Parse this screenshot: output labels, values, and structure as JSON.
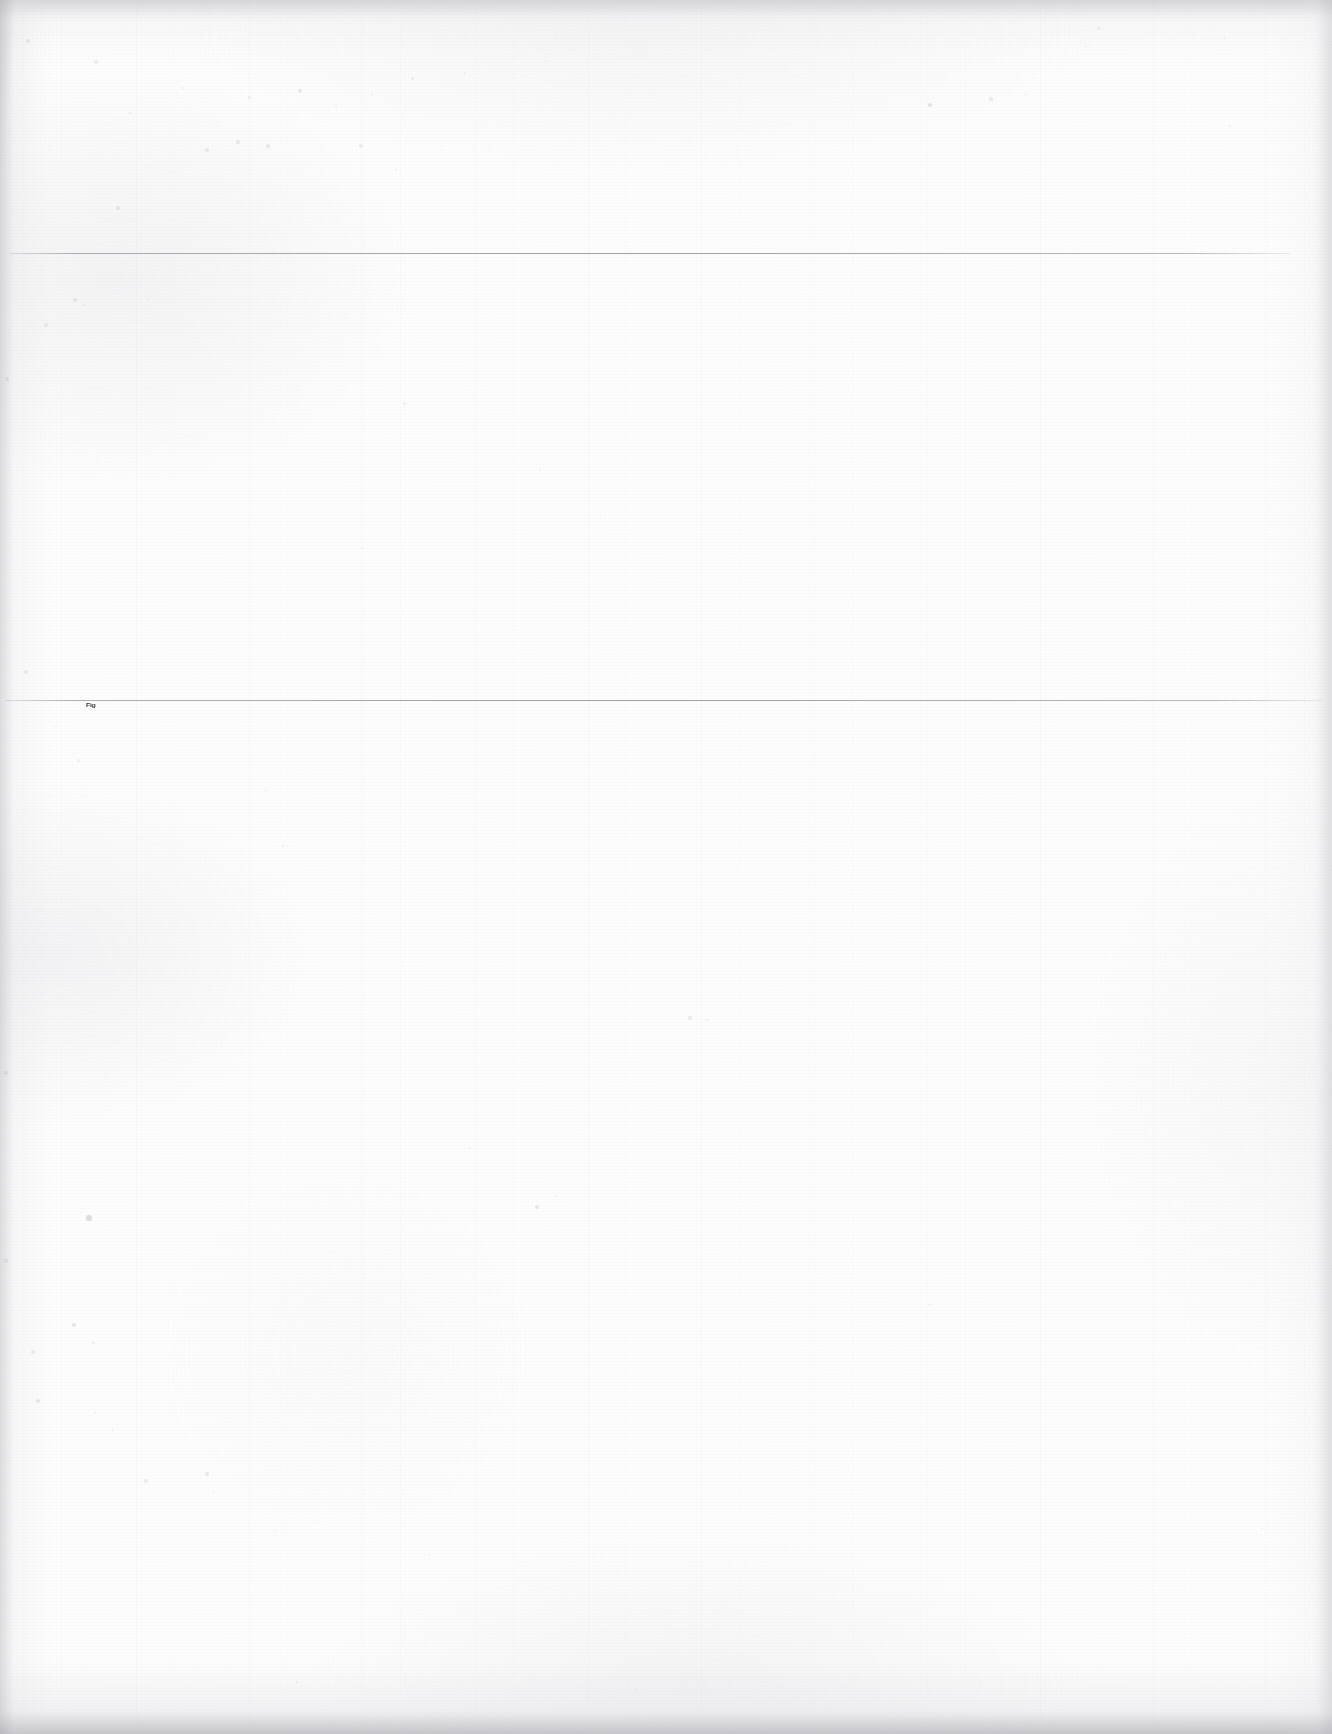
{
  "document": {
    "kind": "scanned-blank-page",
    "page_width": 1332,
    "page_height": 1734,
    "background_color": "#fdfdfd",
    "ink_color": "#2a2a2e",
    "rule_color": "#787882",
    "edge_shadow_color": "#a8a8af"
  },
  "sections": {
    "header_band": {
      "top": 0,
      "bottom": 253,
      "content": ""
    },
    "middle_band": {
      "top": 253,
      "bottom": 700,
      "content": ""
    },
    "body_band": {
      "top": 700,
      "bottom": 1734,
      "content": ""
    }
  },
  "rules": [
    {
      "name": "upper-rule",
      "y": 253,
      "x_start": 10,
      "x_end": 1290
    },
    {
      "name": "lower-rule",
      "y": 700,
      "x_start": 5,
      "x_end": 1322
    }
  ],
  "labels": {
    "caption": {
      "text": "Fig",
      "x": 86,
      "y": 702,
      "legible": false,
      "note": "illegible smudged micro-text"
    }
  },
  "flecks": [
    {
      "x": 28,
      "y": 41,
      "r": 2.0,
      "o": 0.3
    },
    {
      "x": 96,
      "y": 62,
      "r": 1.6,
      "o": 0.24
    },
    {
      "x": 130,
      "y": 113,
      "r": 1.4,
      "o": 0.22
    },
    {
      "x": 183,
      "y": 88,
      "r": 1.2,
      "o": 0.2
    },
    {
      "x": 207,
      "y": 150,
      "r": 1.8,
      "o": 0.26
    },
    {
      "x": 238,
      "y": 142,
      "r": 2.2,
      "o": 0.3
    },
    {
      "x": 249,
      "y": 97,
      "r": 1.5,
      "o": 0.22
    },
    {
      "x": 268,
      "y": 146,
      "r": 1.6,
      "o": 0.25
    },
    {
      "x": 300,
      "y": 91,
      "r": 1.9,
      "o": 0.27
    },
    {
      "x": 336,
      "y": 105,
      "r": 1.3,
      "o": 0.2
    },
    {
      "x": 361,
      "y": 146,
      "r": 1.7,
      "o": 0.24
    },
    {
      "x": 372,
      "y": 94,
      "r": 1.2,
      "o": 0.18
    },
    {
      "x": 396,
      "y": 170,
      "r": 1.1,
      "o": 0.17
    },
    {
      "x": 412,
      "y": 78,
      "r": 1.5,
      "o": 0.21
    },
    {
      "x": 465,
      "y": 73,
      "r": 1.3,
      "o": 0.19
    },
    {
      "x": 546,
      "y": 61,
      "r": 1.2,
      "o": 0.17
    },
    {
      "x": 640,
      "y": 55,
      "r": 1.1,
      "o": 0.16
    },
    {
      "x": 930,
      "y": 105,
      "r": 2.4,
      "o": 0.4
    },
    {
      "x": 991,
      "y": 99,
      "r": 1.6,
      "o": 0.26
    },
    {
      "x": 1026,
      "y": 94,
      "r": 1.3,
      "o": 0.2
    },
    {
      "x": 1086,
      "y": 46,
      "r": 1.2,
      "o": 0.18
    },
    {
      "x": 1098,
      "y": 28,
      "r": 1.5,
      "o": 0.22
    },
    {
      "x": 1225,
      "y": 38,
      "r": 1.3,
      "o": 0.19
    },
    {
      "x": 1230,
      "y": 126,
      "r": 1.2,
      "o": 0.18
    },
    {
      "x": 118,
      "y": 208,
      "r": 1.7,
      "o": 0.25
    },
    {
      "x": 75,
      "y": 300,
      "r": 2.0,
      "o": 0.28
    },
    {
      "x": 84,
      "y": 305,
      "r": 1.4,
      "o": 0.2
    },
    {
      "x": 46,
      "y": 325,
      "r": 1.6,
      "o": 0.23
    },
    {
      "x": 148,
      "y": 299,
      "r": 1.3,
      "o": 0.19
    },
    {
      "x": 404,
      "y": 403,
      "r": 1.5,
      "o": 0.22
    },
    {
      "x": 7,
      "y": 379,
      "r": 2.1,
      "o": 0.32
    },
    {
      "x": 540,
      "y": 470,
      "r": 1.2,
      "o": 0.17
    },
    {
      "x": 362,
      "y": 548,
      "r": 1.4,
      "o": 0.2
    },
    {
      "x": 600,
      "y": 518,
      "r": 1.1,
      "o": 0.16
    },
    {
      "x": 26,
      "y": 672,
      "r": 1.8,
      "o": 0.26
    },
    {
      "x": 56,
      "y": 726,
      "r": 1.3,
      "o": 0.19
    },
    {
      "x": 78,
      "y": 760,
      "r": 1.5,
      "o": 0.21
    },
    {
      "x": 266,
      "y": 790,
      "r": 1.2,
      "o": 0.17
    },
    {
      "x": 283,
      "y": 846,
      "r": 1.4,
      "o": 0.2
    },
    {
      "x": 690,
      "y": 1018,
      "r": 2.0,
      "o": 0.3
    },
    {
      "x": 707,
      "y": 1020,
      "r": 1.4,
      "o": 0.2
    },
    {
      "x": 6,
      "y": 1073,
      "r": 2.2,
      "o": 0.34
    },
    {
      "x": 470,
      "y": 1148,
      "r": 1.2,
      "o": 0.17
    },
    {
      "x": 556,
      "y": 1196,
      "r": 1.1,
      "o": 0.16
    },
    {
      "x": 89,
      "y": 1218,
      "r": 2.6,
      "o": 0.44
    },
    {
      "x": 537,
      "y": 1207,
      "r": 2.0,
      "o": 0.3
    },
    {
      "x": 6,
      "y": 1261,
      "r": 1.9,
      "o": 0.28
    },
    {
      "x": 930,
      "y": 1305,
      "r": 1.3,
      "o": 0.19
    },
    {
      "x": 74,
      "y": 1325,
      "r": 2.1,
      "o": 0.32
    },
    {
      "x": 93,
      "y": 1342,
      "r": 1.5,
      "o": 0.21
    },
    {
      "x": 33,
      "y": 1352,
      "r": 1.7,
      "o": 0.24
    },
    {
      "x": 38,
      "y": 1401,
      "r": 2.2,
      "o": 0.34
    },
    {
      "x": 95,
      "y": 1413,
      "r": 1.4,
      "o": 0.2
    },
    {
      "x": 113,
      "y": 1430,
      "r": 1.2,
      "o": 0.17
    },
    {
      "x": 146,
      "y": 1481,
      "r": 1.6,
      "o": 0.23
    },
    {
      "x": 207,
      "y": 1474,
      "r": 2.0,
      "o": 0.3
    },
    {
      "x": 214,
      "y": 1492,
      "r": 1.3,
      "o": 0.19
    },
    {
      "x": 275,
      "y": 1530,
      "r": 1.2,
      "o": 0.17
    },
    {
      "x": 430,
      "y": 1555,
      "r": 1.1,
      "o": 0.16
    },
    {
      "x": 1262,
      "y": 1528,
      "r": 1.3,
      "o": 0.19
    },
    {
      "x": 297,
      "y": 1682,
      "r": 1.4,
      "o": 0.2
    },
    {
      "x": 636,
      "y": 1690,
      "r": 1.2,
      "o": 0.17
    }
  ]
}
